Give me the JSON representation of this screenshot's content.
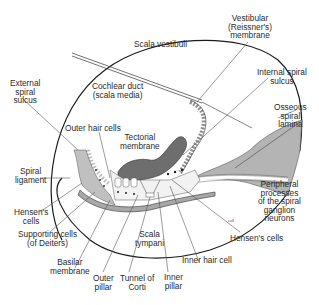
{
  "diagram": {
    "colors": {
      "outline": "#1a1a1a",
      "bone_gray": "#b4b4b4",
      "tissue_light": "#c8c8c8",
      "tectorial_dark": "#6e6e6e",
      "leader_line": "#555555",
      "text": "#2a2a2a",
      "background": "#ffffff"
    },
    "regions": {
      "scala_vestibuli": "Scala vestibuli",
      "cochlear_duct_line1": "Cochlear duct",
      "cochlear_duct_line2": "(scala media)",
      "scala_tympani_line1": "Scala",
      "scala_tympani_line2": "tympani"
    },
    "labels": {
      "vestibular_membrane": [
        "Vestibular",
        "(Reissner's)",
        "membrane"
      ],
      "internal_spiral_sulcus": [
        "Internal spiral",
        "sulcus"
      ],
      "osseous_spiral_lamina": [
        "Osseous",
        "spiral",
        "lamina"
      ],
      "external_spiral_sulcus": [
        "External",
        "spiral",
        "sulcus"
      ],
      "outer_hair_cells": [
        "Outer hair cells"
      ],
      "tectorial_membrane": [
        "Tectorial",
        "membrane"
      ],
      "spiral_ligament": [
        "Spiral",
        "ligament"
      ],
      "hensens_cells_left": [
        "Hensen's",
        "cells"
      ],
      "supporting_cells": [
        "Supporting cells",
        "(of Deiters)"
      ],
      "basilar_membrane": [
        "Basilar",
        "membrane"
      ],
      "outer_pillar": [
        "Outer",
        "pillar"
      ],
      "tunnel_of_corti": [
        "Tunnel of",
        "Corti"
      ],
      "inner_pillar": [
        "Inner",
        "pillar"
      ],
      "inner_hair_cell": [
        "Inner hair cell"
      ],
      "hensens_cells_right": [
        "Hensen's cells"
      ],
      "peripheral_processes": [
        "Peripheral",
        "processes",
        "of the spiral",
        "ganglion",
        "neurons"
      ]
    }
  }
}
